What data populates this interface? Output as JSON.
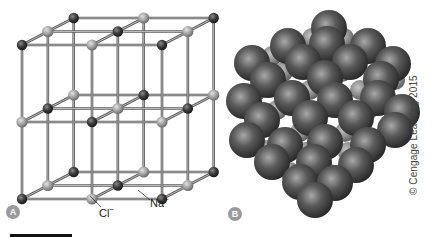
{
  "figure": {
    "panels": [
      {
        "id": "A",
        "badge": "A",
        "description": "Ball-and-stick model of NaCl crystal lattice"
      },
      {
        "id": "B",
        "badge": "B",
        "description": "Space-filling model of NaCl crystal"
      }
    ],
    "labels": {
      "chloride": "Cl",
      "chloride_charge": "−",
      "sodium": "Na",
      "sodium_charge": "+"
    },
    "copyright": "© Cengage Learning 2015",
    "colors": {
      "chloride_ion": "#3a3a3a",
      "sodium_ion": "#9e9e9e",
      "bond": "#6d6d6d",
      "badge": "#9a9a9a",
      "sphere": "#4a4a4a"
    }
  }
}
